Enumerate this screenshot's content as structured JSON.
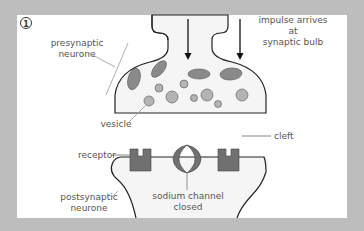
{
  "diagram": {
    "step_number": "1",
    "labels": {
      "presynaptic_line1": "presynaptic",
      "presynaptic_line2": "neurone",
      "impulse_line1": "impulse arrives",
      "impulse_line2": "at",
      "impulse_line3": "synaptic bulb",
      "vesicle": "vesicle",
      "cleft": "cleft",
      "receptor": "receptor",
      "postsynaptic_line1": "postsynaptic",
      "postsynaptic_line2": "neurone",
      "sodium_line1": "sodium channel",
      "sodium_line2": "closed"
    },
    "colors": {
      "background": "#bdbdbd",
      "panel": "#ffffff",
      "cell_fill": "#f4f4f4",
      "outline": "#222222",
      "receptor": "#707070",
      "vesicle": "#b0b0b0",
      "mitochondria": "#888888",
      "label_text": "#555555"
    }
  }
}
